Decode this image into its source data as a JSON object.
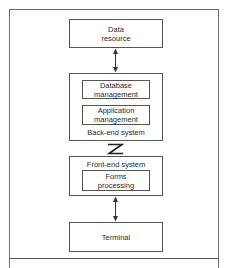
{
  "diagram": {
    "nodes": {
      "data_resource": {
        "label": "Data\nresource"
      },
      "backend": {
        "label": "Back-end system",
        "children": {
          "database_management": {
            "label": "Database\nmanagement"
          },
          "application_management": {
            "label": "Application\nmanagement"
          }
        }
      },
      "frontend": {
        "label": "Front-end system",
        "children": {
          "forms_processing": {
            "label": "Forms\nprocessing"
          }
        }
      },
      "terminal": {
        "label": "Terminal"
      }
    },
    "edges": [
      {
        "from": "data_resource",
        "to": "backend",
        "type": "bidirectional-arrow"
      },
      {
        "from": "backend",
        "to": "frontend",
        "type": "network-link-zigzag"
      },
      {
        "from": "frontend",
        "to": "terminal",
        "type": "bidirectional-arrow"
      }
    ],
    "colors": {
      "stroke": "#555555",
      "text": "#2a2a2a",
      "background": "#ffffff"
    }
  }
}
